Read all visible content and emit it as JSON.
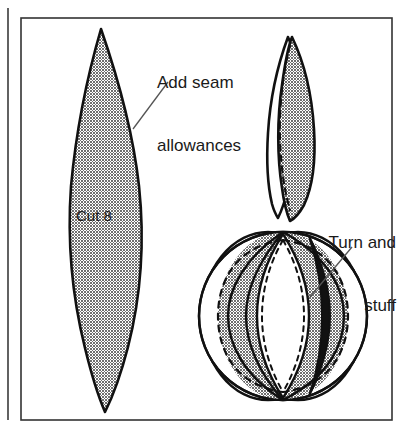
{
  "figure": {
    "type": "sewing-pattern-instructions",
    "colors": {
      "ink": "#111111",
      "fabric_gray": "#8a8a8a",
      "fabric_black": "#111111",
      "fabric_white": "#ffffff",
      "paper": "#ffffff",
      "leader_line": "#555555",
      "frame": "#333333"
    },
    "annotations": [
      {
        "id": "seam",
        "text": "Add seam\nallowances",
        "line1": "Add seam",
        "line2": "allowances",
        "align": "left",
        "points_to": "pattern-piece-edge"
      },
      {
        "id": "turn",
        "text": "Turn and\nstuff",
        "line1": "Turn and",
        "line2": "stuff",
        "align": "right",
        "points_to": "assembled-ball-seam"
      },
      {
        "id": "cut8",
        "text": "Cut 8",
        "line1": "Cut 8",
        "line2": "",
        "align": "left",
        "points_to": "pattern-piece-interior"
      }
    ],
    "parts": [
      {
        "name": "pattern-piece",
        "description": "Large gray lens-shaped pattern panel, pointed at both ends",
        "label": "Cut 8",
        "quantity": 8
      },
      {
        "name": "sewn-pair",
        "description": "Two panels stitched together, dashed seam line shown"
      },
      {
        "name": "assembled-ball",
        "description": "Finished ball of eight panels, turned and stuffed",
        "panels": 8
      }
    ]
  }
}
